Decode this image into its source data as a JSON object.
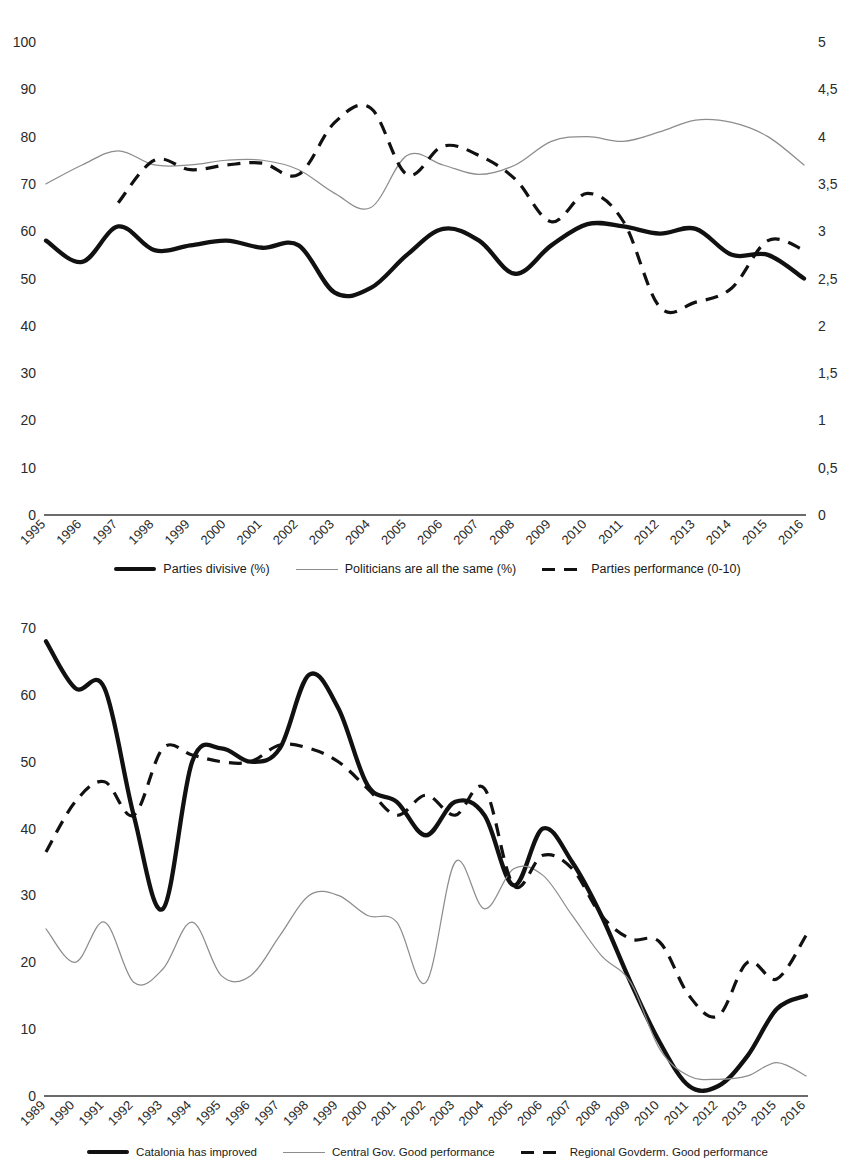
{
  "page": {
    "clipped_header_text": ""
  },
  "figure1": {
    "name": "party-attitudes-chart",
    "left_axis": {
      "label": "",
      "ticks": [
        "0",
        "10",
        "20",
        "30",
        "40",
        "50",
        "60",
        "70",
        "80",
        "90",
        "100"
      ],
      "min": 0,
      "max": 100
    },
    "right_axis": {
      "label": "",
      "ticks": [
        "0",
        "0,5",
        "1",
        "1,5",
        "2",
        "2,5",
        "3",
        "3,5",
        "4",
        "4,5",
        "5"
      ],
      "min": 0,
      "max": 5
    },
    "legend": [
      {
        "label": "Parties divisive (%)",
        "style": "thick"
      },
      {
        "label": "Politicians are all the same (%)",
        "style": "thin"
      },
      {
        "label": "Parties performance (0-10)",
        "style": "dashed"
      }
    ]
  },
  "figure2": {
    "name": "government-performance-chart",
    "left_axis": {
      "label": "",
      "ticks": [
        "0",
        "10",
        "20",
        "30",
        "40",
        "50",
        "60",
        "70"
      ],
      "min": 0,
      "max": 70
    },
    "legend": [
      {
        "label": "Catalonia has improved",
        "style": "thick"
      },
      {
        "label": "Central Gov. Good performance",
        "style": "thin"
      },
      {
        "label": "Regional Govderm. Good performance",
        "style": "dashed"
      }
    ]
  },
  "chart_data": [
    {
      "type": "line",
      "id": "figure1",
      "title": "",
      "xlabel": "",
      "ylabel": "",
      "y2label": "",
      "ylim": [
        0,
        100
      ],
      "y2lim": [
        0,
        5
      ],
      "grid": false,
      "legend_position": "bottom",
      "categories": [
        "1995",
        "1996",
        "1997",
        "1998",
        "1999",
        "2000",
        "2001",
        "2002",
        "2003",
        "2004",
        "2005",
        "2006",
        "2007",
        "2008",
        "2009",
        "2010",
        "2011",
        "2012",
        "2013",
        "2014",
        "2015",
        "2016"
      ],
      "series": [
        {
          "name": "Parties divisive (%)",
          "style": "thick",
          "axis": "left",
          "values": [
            58,
            53.5,
            61,
            56,
            57,
            58,
            56.5,
            57,
            47,
            48,
            55,
            60.5,
            58,
            51,
            57,
            61.5,
            61,
            59.5,
            60.5,
            55,
            55,
            50
          ]
        },
        {
          "name": "Politicians are all the same (%)",
          "style": "thin",
          "axis": "left",
          "values": [
            70,
            74,
            77,
            74,
            74,
            75,
            75,
            73,
            68,
            65,
            76,
            74,
            72,
            74,
            79,
            80,
            79,
            81,
            83.5,
            83,
            80,
            74
          ]
        },
        {
          "name": "Parties performance (0-10)",
          "style": "dashed",
          "axis": "right",
          "values": [
            null,
            null,
            3.3,
            3.75,
            3.65,
            3.7,
            3.72,
            3.6,
            4.15,
            4.3,
            3.6,
            3.9,
            3.8,
            3.55,
            3.1,
            3.4,
            3.1,
            2.2,
            2.25,
            2.4,
            2.9,
            2.8
          ]
        }
      ]
    },
    {
      "type": "line",
      "id": "figure2",
      "title": "",
      "xlabel": "",
      "ylabel": "",
      "ylim": [
        0,
        70
      ],
      "grid": false,
      "legend_position": "bottom",
      "categories": [
        "1989",
        "1990",
        "1991",
        "1992",
        "1993",
        "1994",
        "1995",
        "1996",
        "1997",
        "1998",
        "1999",
        "2000",
        "2001",
        "2002",
        "2003",
        "2004",
        "2005",
        "2006",
        "2007",
        "2008",
        "2009",
        "2010",
        "2011",
        "2012",
        "2013",
        "2015",
        "2016"
      ],
      "series": [
        {
          "name": "Catalonia has improved",
          "style": "thick",
          "axis": "left",
          "values": [
            68,
            61,
            61,
            42,
            28,
            50,
            52,
            50,
            52,
            63,
            58,
            46.5,
            44,
            39,
            44,
            42,
            31.5,
            40,
            35,
            27,
            17,
            8,
            1.5,
            1.5,
            6,
            13,
            15
          ]
        },
        {
          "name": "Central Gov. Good performance",
          "style": "thin",
          "axis": "left",
          "values": [
            25,
            20,
            26,
            17,
            19,
            26,
            18,
            18,
            24,
            30,
            30,
            27,
            26,
            17,
            35,
            28,
            34,
            33,
            27,
            21,
            17,
            7,
            3,
            2.5,
            3,
            5,
            3
          ]
        },
        {
          "name": "Regional Govderm. Good performance",
          "style": "dashed",
          "axis": "left",
          "values": [
            36.5,
            44,
            47,
            42,
            52,
            51,
            50,
            50,
            52.5,
            52,
            50,
            46,
            42,
            45,
            42,
            46,
            31.5,
            36,
            34,
            27,
            23.5,
            23,
            15,
            12,
            20,
            17.5,
            24
          ]
        }
      ]
    }
  ]
}
